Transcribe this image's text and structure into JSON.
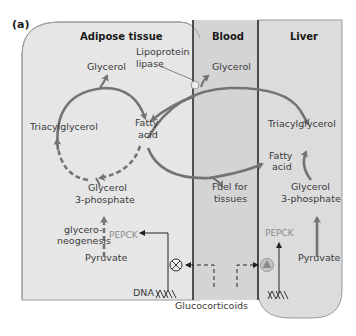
{
  "panel_label": "(a)",
  "regions": {
    "adipose": "Adipose tissue",
    "blood": "Blood",
    "liver": "Liver"
  },
  "adipose": {
    "glycerol": "Glycerol",
    "lipase_line1": "Lipoprotein",
    "lipase_line2": "lipase",
    "triacylglycerol": "Triacylglycerol",
    "fatty_line1": "Fatty",
    "fatty_line2": "acid",
    "g3p_line1": "Glycerol",
    "g3p_line2": "3-phosphate",
    "glyceroneo_line1": "glycero-",
    "glyceroneo_line2": "neogenesis",
    "pepck": "PEPCK",
    "pyruvate": "Pyruvate",
    "dna": "DNA",
    "gene_effect": "inhibited"
  },
  "blood": {
    "glycerol": "Glycerol",
    "fuel_line1": "Fuel for",
    "fuel_line2": "tissues",
    "glucocorticoids": "Glucocorticoids"
  },
  "liver": {
    "triacylglycerol": "Triacylglycerol",
    "fatty_line1": "Fatty",
    "fatty_line2": "acid",
    "g3p_line1": "Glycerol",
    "g3p_line2": "3-phosphate",
    "pepck": "PEPCK",
    "pyruvate": "Pyruvate",
    "gene_effect": "activated"
  },
  "colors": {
    "background_region": "#e6e6e6",
    "blood_region": "#d2d2d2",
    "arrow": "#737373",
    "border": "#8a8a8a",
    "divider": "#2e2e2e",
    "pepck": "#8c8c8c"
  }
}
